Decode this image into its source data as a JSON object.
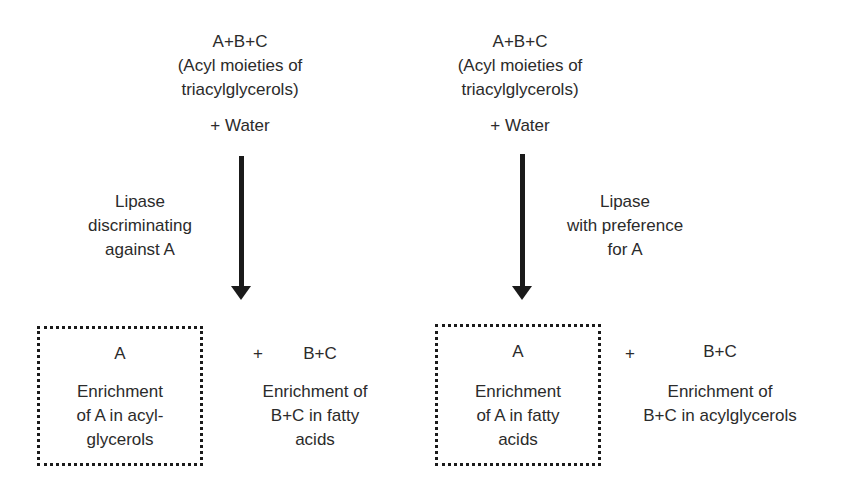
{
  "left_panel": {
    "reactants": "A+B+C",
    "reactants_note_line1": "(Acyl moieties of",
    "reactants_note_line2": "triacylglycerols)",
    "water": "+  Water",
    "enzyme_line1": "Lipase",
    "enzyme_line2": "discriminating",
    "enzyme_line3": "against  A",
    "product_box": {
      "label": "A",
      "desc_line1": "Enrichment",
      "desc_line2": "of  A  in acyl-",
      "desc_line3": "glycerols"
    },
    "plus": "+",
    "other_product": {
      "label": "B+C",
      "desc_line1": "Enrichment of",
      "desc_line2": "B+C  in fatty",
      "desc_line3": "acids"
    }
  },
  "right_panel": {
    "reactants": "A+B+C",
    "reactants_note_line1": "(Acyl moieties of",
    "reactants_note_line2": "triacylglycerols)",
    "water": "+  Water",
    "enzyme_line1": "Lipase",
    "enzyme_line2": "with preference",
    "enzyme_line3": "for  A",
    "product_box": {
      "label": "A",
      "desc_line1": "Enrichment",
      "desc_line2": "of  A  in fatty",
      "desc_line3": "acids"
    },
    "plus": "+",
    "other_product": {
      "label": "B+C",
      "desc_line1": "Enrichment of",
      "desc_line2": "B+C  in acylglycerols"
    }
  }
}
